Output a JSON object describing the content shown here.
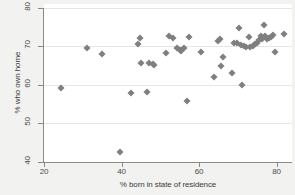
{
  "chart_data": {
    "type": "scatter",
    "title": "",
    "xlabel": "% born in state of residence",
    "ylabel": "% who own home",
    "xlim": [
      20,
      84
    ],
    "ylim": [
      40,
      81
    ],
    "xticks": [
      20,
      40,
      60,
      80
    ],
    "yticks": [
      40,
      50,
      60,
      70,
      80
    ],
    "grid": "horizontal",
    "legend": "none",
    "marker": "diamond",
    "marker_color": "#7f7f7f",
    "points": [
      {
        "x": 24.5,
        "y": 59.2
      },
      {
        "x": 31.0,
        "y": 69.5
      },
      {
        "x": 35.0,
        "y": 68.1
      },
      {
        "x": 39.5,
        "y": 42.5
      },
      {
        "x": 42.5,
        "y": 58.0
      },
      {
        "x": 44.2,
        "y": 70.6
      },
      {
        "x": 44.8,
        "y": 72.3
      },
      {
        "x": 45.0,
        "y": 65.6
      },
      {
        "x": 46.5,
        "y": 58.2
      },
      {
        "x": 47.2,
        "y": 65.8
      },
      {
        "x": 48.2,
        "y": 65.4
      },
      {
        "x": 48.5,
        "y": 65.1
      },
      {
        "x": 51.5,
        "y": 68.4
      },
      {
        "x": 52.2,
        "y": 72.7
      },
      {
        "x": 53.2,
        "y": 72.1
      },
      {
        "x": 54.2,
        "y": 69.7
      },
      {
        "x": 55.0,
        "y": 69.0
      },
      {
        "x": 55.3,
        "y": 68.8
      },
      {
        "x": 56.2,
        "y": 69.5
      },
      {
        "x": 57.0,
        "y": 55.9
      },
      {
        "x": 57.5,
        "y": 72.5
      },
      {
        "x": 60.5,
        "y": 68.6
      },
      {
        "x": 63.8,
        "y": 62.1
      },
      {
        "x": 64.8,
        "y": 71.4
      },
      {
        "x": 65.5,
        "y": 71.8
      },
      {
        "x": 65.8,
        "y": 64.9
      },
      {
        "x": 66.2,
        "y": 67.2
      },
      {
        "x": 68.5,
        "y": 63.2
      },
      {
        "x": 69.0,
        "y": 71.0
      },
      {
        "x": 69.8,
        "y": 70.9
      },
      {
        "x": 70.2,
        "y": 74.7
      },
      {
        "x": 70.8,
        "y": 70.4
      },
      {
        "x": 71.2,
        "y": 60.0
      },
      {
        "x": 71.5,
        "y": 70.1
      },
      {
        "x": 72.2,
        "y": 69.9
      },
      {
        "x": 72.8,
        "y": 72.4
      },
      {
        "x": 73.2,
        "y": 69.8
      },
      {
        "x": 74.0,
        "y": 70.2
      },
      {
        "x": 74.5,
        "y": 70.6
      },
      {
        "x": 75.0,
        "y": 71.0
      },
      {
        "x": 75.6,
        "y": 71.6
      },
      {
        "x": 76.0,
        "y": 72.8
      },
      {
        "x": 76.2,
        "y": 71.9
      },
      {
        "x": 76.8,
        "y": 75.6
      },
      {
        "x": 77.0,
        "y": 72.6
      },
      {
        "x": 77.5,
        "y": 72.0
      },
      {
        "x": 78.0,
        "y": 72.2
      },
      {
        "x": 78.6,
        "y": 72.5
      },
      {
        "x": 79.0,
        "y": 73.0
      },
      {
        "x": 79.5,
        "y": 68.6
      },
      {
        "x": 82.0,
        "y": 73.2
      }
    ]
  }
}
